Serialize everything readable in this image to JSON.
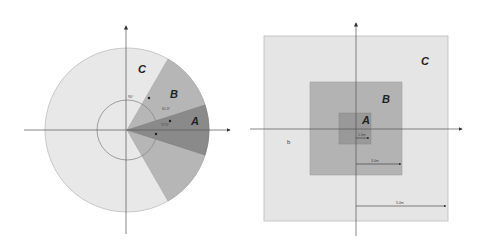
{
  "left_diagram": {
    "title": "Polar sector zones",
    "zones": [
      {
        "label": "C",
        "fill": "#e8e8e8",
        "description": "Outer circle"
      },
      {
        "label": "B",
        "fill": "#b6b6b6",
        "description": "Wide sector"
      },
      {
        "label": "A",
        "fill": "#8a8a8a",
        "description": "Narrow sector"
      }
    ],
    "angle_labels": [
      "90°",
      "61.3°",
      "17.5°"
    ]
  },
  "right_diagram": {
    "title": "Square zones",
    "zones": [
      {
        "label": "C",
        "fill": "#e5e5e5",
        "description": "Outer square"
      },
      {
        "label": "B",
        "fill": "#b3b3b3",
        "description": "Middle square"
      },
      {
        "label": "A",
        "fill": "#999999",
        "description": "Inner square"
      }
    ],
    "dimension_labels": [
      "1.0m",
      "3.0m",
      "5.0m"
    ],
    "marker": "b"
  }
}
